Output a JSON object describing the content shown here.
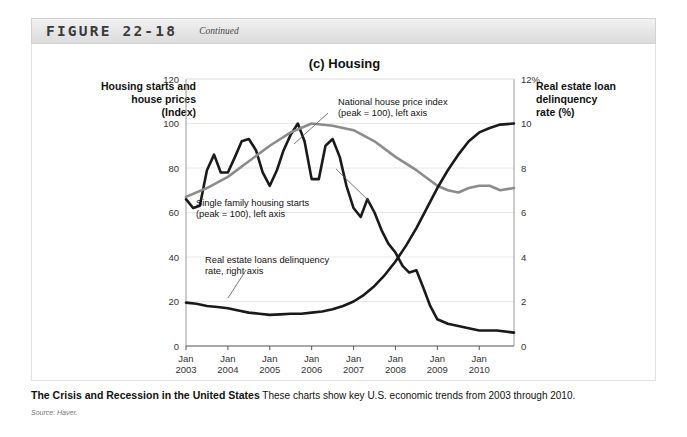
{
  "figure": {
    "label": "FIGURE 22-18",
    "continued": "Continued"
  },
  "chart_title": "(c) Housing",
  "axis_titles": {
    "left": "Housing starts and house prices (Index)",
    "left_line1": "Housing starts and",
    "left_line2": "house prices",
    "left_line3": "(Index)",
    "right_line1": "Real estate loan",
    "right_line2": "delinquency",
    "right_line3": "rate (%)"
  },
  "annotations": {
    "house_price": {
      "line1": "National house price index",
      "line2": "(peak = 100), left axis"
    },
    "housing_starts": {
      "line1": "Single family housing starts",
      "line2": "(peak = 100), left axis"
    },
    "delinquency": {
      "line1": "Real estate loans delinquency",
      "line2": "rate, right axis"
    }
  },
  "caption": {
    "bold": "The Crisis and Recession in the United States",
    "text": " These charts show key U.S. economic trends from 2003 through 2010.",
    "source": "Source: Haver."
  },
  "colors": {
    "house_price_line": "#8c8c8c",
    "housing_starts_line": "#1a1a1a",
    "delinquency_line": "#1a1a1a",
    "grid": "#e8e8e8",
    "axis": "#9a9a9a",
    "header_bg": "#e8e8e8"
  },
  "chart_data": {
    "type": "line",
    "title": "(c) Housing",
    "xlabel": "",
    "ylabel": "Housing starts and house prices (Index)",
    "y2label": "Real estate loan delinquency rate (%)",
    "ylim": [
      0,
      120
    ],
    "y2lim": [
      0,
      12
    ],
    "yticks": [
      0,
      20,
      40,
      60,
      80,
      100,
      120
    ],
    "y2ticks": [
      0,
      2,
      4,
      6,
      8,
      10,
      12
    ],
    "y2tick_labels": [
      "0",
      "2",
      "4",
      "6",
      "8",
      "10",
      "12%"
    ],
    "grid": true,
    "legend": "annotations",
    "xtick_labels": [
      [
        "Jan",
        "2003"
      ],
      [
        "Jan",
        "2004"
      ],
      [
        "Jan",
        "2005"
      ],
      [
        "Jan",
        "2006"
      ],
      [
        "Jan",
        "2007"
      ],
      [
        "Jan",
        "2008"
      ],
      [
        "Jan",
        "2009"
      ],
      [
        "Jan",
        "2010"
      ]
    ],
    "x_start_year": 2003,
    "x_end_year": 2010.83,
    "series": [
      {
        "name": "Single family housing starts (peak = 100), left axis",
        "axis": "left",
        "color": "#1a1a1a",
        "width": 2.6,
        "x": [
          2003.0,
          2003.17,
          2003.33,
          2003.5,
          2003.67,
          2003.83,
          2004.0,
          2004.17,
          2004.33,
          2004.5,
          2004.67,
          2004.83,
          2005.0,
          2005.17,
          2005.33,
          2005.5,
          2005.67,
          2005.83,
          2006.0,
          2006.17,
          2006.33,
          2006.5,
          2006.67,
          2006.83,
          2007.0,
          2007.17,
          2007.33,
          2007.5,
          2007.67,
          2007.83,
          2008.0,
          2008.17,
          2008.33,
          2008.5,
          2008.67,
          2008.83,
          2009.0,
          2009.25,
          2009.5,
          2009.75,
          2010.0,
          2010.42,
          2010.83
        ],
        "y": [
          66,
          62,
          63,
          79,
          86,
          78,
          78,
          85,
          92,
          93,
          88,
          78,
          72,
          79,
          88,
          95,
          100,
          92,
          75,
          75,
          90,
          93,
          85,
          72,
          62,
          58,
          66,
          60,
          52,
          46,
          42,
          36,
          33,
          34,
          26,
          18,
          12,
          10,
          9,
          8,
          7,
          7,
          6
        ]
      },
      {
        "name": "National house price index (peak = 100), left axis",
        "axis": "left",
        "color": "#8c8c8c",
        "width": 2.6,
        "x": [
          2003.0,
          2003.5,
          2004.0,
          2004.5,
          2005.0,
          2005.5,
          2006.0,
          2006.5,
          2007.0,
          2007.5,
          2008.0,
          2008.5,
          2009.0,
          2009.25,
          2009.5,
          2009.75,
          2010.0,
          2010.25,
          2010.5,
          2010.83
        ],
        "y": [
          67,
          71,
          76,
          83,
          90,
          96,
          100,
          99,
          97,
          92,
          85,
          79,
          72,
          70,
          69,
          71,
          72,
          72,
          70,
          71
        ]
      },
      {
        "name": "Real estate loans delinquency rate, right axis",
        "axis": "right",
        "color": "#1a1a1a",
        "width": 2.6,
        "x": [
          2003.0,
          2003.25,
          2003.5,
          2003.75,
          2004.0,
          2004.25,
          2004.5,
          2004.75,
          2005.0,
          2005.25,
          2005.5,
          2005.75,
          2006.0,
          2006.25,
          2006.5,
          2006.75,
          2007.0,
          2007.25,
          2007.5,
          2007.75,
          2008.0,
          2008.25,
          2008.5,
          2008.75,
          2009.0,
          2009.25,
          2009.5,
          2009.75,
          2010.0,
          2010.25,
          2010.5,
          2010.83
        ],
        "y": [
          1.95,
          1.9,
          1.8,
          1.75,
          1.7,
          1.6,
          1.5,
          1.45,
          1.4,
          1.42,
          1.45,
          1.45,
          1.5,
          1.55,
          1.65,
          1.8,
          2.0,
          2.3,
          2.7,
          3.2,
          3.8,
          4.5,
          5.3,
          6.2,
          7.1,
          7.9,
          8.6,
          9.2,
          9.6,
          9.8,
          9.95,
          10.0
        ]
      }
    ]
  }
}
